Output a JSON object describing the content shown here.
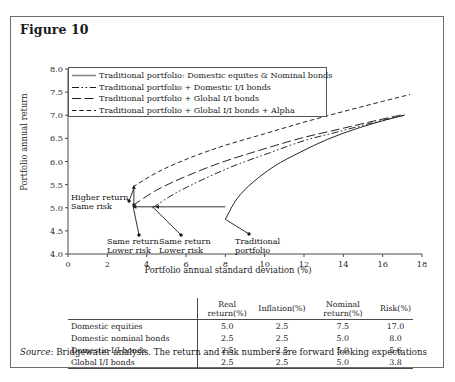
{
  "figure": {
    "title": "Figure 10",
    "source_prefix": "Source",
    "source_text": ": Bridgewater analysis. The return and risk numbers are forward looking expectations"
  },
  "chart_data": {
    "type": "line",
    "title": "Figure 10",
    "xlabel": "Portfolio annual standard deviation (%)",
    "ylabel": "Portfolio annual return",
    "xlim": [
      0,
      18
    ],
    "ylim": [
      4.0,
      8.0
    ],
    "xticks": [
      0,
      2,
      4,
      6,
      8,
      10,
      12,
      14,
      16,
      18
    ],
    "xtick_labels": [
      "0",
      "2",
      "4",
      "6",
      "8",
      "10",
      "12",
      "14",
      "16",
      "18"
    ],
    "yticks": [
      4.0,
      4.5,
      5.0,
      5.5,
      6.0,
      6.5,
      7.0,
      7.5,
      8.0
    ],
    "ytick_labels": [
      "4.0",
      "4.5",
      "5.0",
      "5.5",
      "6.0",
      "6.5",
      "7.0",
      "7.5",
      "8.0"
    ],
    "grid": false,
    "legend_position": "upper-left",
    "series": [
      {
        "name": "Traditional portfolio: Domestic equites & Nominal bonds",
        "style": "solid",
        "points": [
          [
            8.0,
            4.75
          ],
          [
            8.6,
            5.2
          ],
          [
            9.4,
            5.55
          ],
          [
            10.5,
            5.9
          ],
          [
            11.8,
            6.2
          ],
          [
            13.2,
            6.48
          ],
          [
            14.6,
            6.7
          ],
          [
            16.0,
            6.88
          ],
          [
            17.1,
            7.0
          ]
        ]
      },
      {
        "name": "Traditional portfolio + Domestic I/I bonds",
        "style": "dash-dot-dot",
        "points": [
          [
            4.3,
            5.0
          ],
          [
            5.4,
            5.3
          ],
          [
            6.8,
            5.6
          ],
          [
            8.4,
            5.9
          ],
          [
            10.2,
            6.18
          ],
          [
            12.0,
            6.45
          ],
          [
            13.8,
            6.65
          ],
          [
            15.6,
            6.85
          ],
          [
            17.1,
            7.0
          ]
        ]
      },
      {
        "name": "Traditional portfolio + Global I/I bonds",
        "style": "long-dash",
        "points": [
          [
            3.3,
            5.05
          ],
          [
            4.5,
            5.38
          ],
          [
            6.0,
            5.68
          ],
          [
            7.8,
            5.98
          ],
          [
            9.8,
            6.25
          ],
          [
            11.8,
            6.5
          ],
          [
            13.8,
            6.7
          ],
          [
            15.6,
            6.88
          ],
          [
            17.1,
            7.02
          ]
        ]
      },
      {
        "name": "Traditional portfolio + Global I/I bonds + Alpha",
        "style": "dashed",
        "points": [
          [
            3.3,
            5.45
          ],
          [
            4.6,
            5.78
          ],
          [
            6.2,
            6.08
          ],
          [
            8.0,
            6.35
          ],
          [
            10.0,
            6.6
          ],
          [
            12.0,
            6.85
          ],
          [
            14.0,
            7.08
          ],
          [
            16.0,
            7.3
          ],
          [
            17.4,
            7.45
          ]
        ]
      }
    ],
    "annotations": [
      {
        "label_line1": "Higher return",
        "label_line2": "Same risk",
        "x": 3.35,
        "y": 5.42
      },
      {
        "label_line1": "Same return",
        "label_line2": "Lower risk",
        "x": 3.3,
        "y": 5.05
      },
      {
        "label_line1": "Same return",
        "label_line2": "Lower risk",
        "x": 4.3,
        "y": 5.02
      },
      {
        "label_line1": "Traditional",
        "label_line2": "portfolio",
        "x": 8.0,
        "y": 4.75
      }
    ]
  },
  "table": {
    "columns": [
      "",
      "Real return(%)",
      "Inflation(%)",
      "Nominal return(%)",
      "Risk(%)"
    ],
    "rows": [
      {
        "name": "Domestic equities",
        "real_return": "5.0",
        "inflation": "2.5",
        "nominal_return": "7.5",
        "risk": "17.0"
      },
      {
        "name": "Domestic nominal bonds",
        "real_return": "2.5",
        "inflation": "2.5",
        "nominal_return": "5.0",
        "risk": "8.0"
      },
      {
        "name": "Domestic I/I bonds",
        "real_return": "2.5",
        "inflation": "2.5",
        "nominal_return": "5.0",
        "risk": "5.6"
      },
      {
        "name": "Global I/I bonds",
        "real_return": "2.5",
        "inflation": "2.5",
        "nominal_return": "5.0",
        "risk": "3.8"
      }
    ]
  }
}
